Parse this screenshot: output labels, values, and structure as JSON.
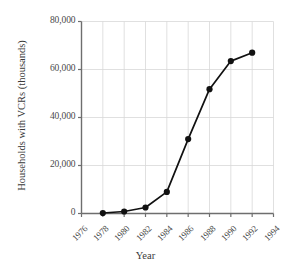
{
  "chart_data": {
    "type": "line",
    "title": "",
    "xlabel": "Year",
    "ylabel": "Households with VCRs (thousands)",
    "x": [
      1978,
      1980,
      1982,
      1984,
      1986,
      1988,
      1990,
      1992
    ],
    "values": [
      200,
      840,
      2500,
      9000,
      31000,
      51800,
      63500,
      67000
    ],
    "series": [
      {
        "name": "Households with VCRs",
        "x": [
          1978,
          1980,
          1982,
          1984,
          1986,
          1988,
          1990,
          1992
        ],
        "values": [
          200,
          840,
          2500,
          9000,
          31000,
          51800,
          63500,
          67000
        ]
      }
    ],
    "xlim": [
      1976,
      1994
    ],
    "ylim": [
      0,
      80000
    ],
    "xticks": [
      1976,
      1978,
      1980,
      1982,
      1984,
      1986,
      1988,
      1990,
      1992,
      1994
    ],
    "yticks": [
      0,
      20000,
      40000,
      60000,
      80000
    ],
    "xtick_labels": [
      "1976",
      "1978",
      "1980",
      "1982",
      "1984",
      "1986",
      "1988",
      "1990",
      "1992",
      "1994"
    ],
    "ytick_labels": [
      "0",
      "20,000",
      "40,000",
      "60,000",
      "80,000"
    ],
    "grid": true,
    "grid_axis": "both",
    "legend": null,
    "legend_position": "none",
    "annotations": [],
    "line_color": "#111111",
    "marker": "circle",
    "marker_color": "#111111",
    "grid_color": "#d8d8d8",
    "axis_color": "#6e6e6e",
    "background_color": "#ffffff"
  }
}
